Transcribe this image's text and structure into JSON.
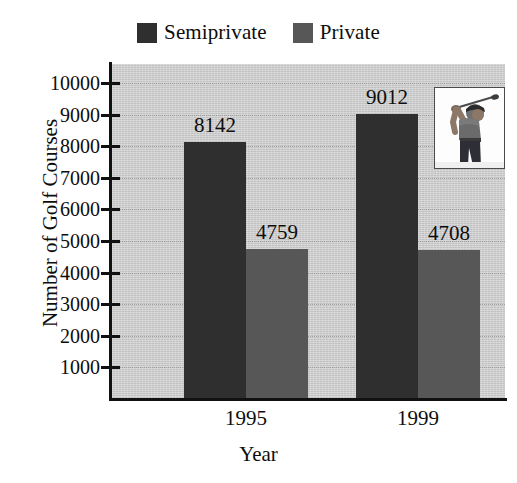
{
  "chart_data": {
    "type": "bar",
    "title": "",
    "xlabel": "Year",
    "ylabel": "Number of Golf Courses",
    "categories": [
      "1995",
      "1999"
    ],
    "series": [
      {
        "name": "Semiprivate",
        "color": "#2f2f2f",
        "values": [
          8142,
          9012
        ]
      },
      {
        "name": "Private",
        "color": "#575757",
        "values": [
          4759,
          4708
        ]
      }
    ],
    "value_labels": [
      "8142",
      "4759",
      "9012",
      "4708"
    ],
    "ylim": [
      0,
      10600
    ],
    "yticks": [
      1000,
      2000,
      3000,
      4000,
      5000,
      6000,
      7000,
      8000,
      9000,
      10000
    ],
    "ytick_labels": [
      "1000",
      "2000",
      "3000",
      "4000",
      "5000",
      "6000",
      "7000",
      "8000",
      "9000",
      "10000"
    ],
    "grid": true,
    "grid_style": "dotted-horizontal",
    "legend_position": "top-center",
    "plot_background": "#cfcfcf",
    "figure_background": "#ffffff"
  },
  "legend": {
    "entries": [
      {
        "label": "Semiprivate",
        "color": "#2f2f2f"
      },
      {
        "label": "Private",
        "color": "#575757"
      }
    ]
  },
  "axes": {
    "y_title": "Number of Golf Courses",
    "x_title": "Year",
    "y_labels": [
      "10000",
      "9000",
      "8000",
      "7000",
      "6000",
      "5000",
      "4000",
      "3000",
      "2000",
      "1000"
    ],
    "x_labels": [
      "1995",
      "1999"
    ]
  },
  "bars": [
    {
      "group": "1995",
      "series": "Semiprivate",
      "value": 8142,
      "label": "8142"
    },
    {
      "group": "1995",
      "series": "Private",
      "value": 4759,
      "label": "4759"
    },
    {
      "group": "1999",
      "series": "Semiprivate",
      "value": 9012,
      "label": "9012"
    },
    {
      "group": "1999",
      "series": "Private",
      "value": 4708,
      "label": "4708"
    }
  ],
  "inset": {
    "name": "golfer-photo",
    "description": "Photograph of a golfer completing a swing"
  }
}
